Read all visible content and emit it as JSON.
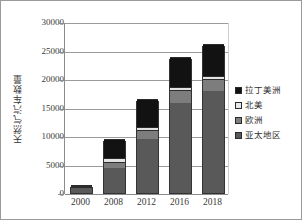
{
  "chart_data": {
    "type": "bar",
    "subtype": "stacked-column",
    "title": "",
    "xlabel": "",
    "ylabel": "天然气汽车数量",
    "categories": [
      "2000",
      "2008",
      "2012",
      "2016",
      "2018"
    ],
    "ylim": [
      0,
      30000
    ],
    "yticks": [
      0,
      5000,
      10000,
      15000,
      20000,
      25000,
      30000
    ],
    "ytick_labels": [
      "0",
      "5000",
      "10000",
      "15000",
      "20000",
      "25000",
      "30000"
    ],
    "grid": true,
    "grid_axis": "y",
    "legend_position": "right",
    "series": [
      {
        "name": "亚太地区",
        "key": "asia",
        "color": "#595959",
        "values": [
          1150,
          4500,
          9700,
          16000,
          18200
        ]
      },
      {
        "name": "欧洲",
        "key": "europe",
        "color": "#7d7d7d",
        "values": [
          80,
          900,
          1350,
          2150,
          1900
        ]
      },
      {
        "name": "北美",
        "key": "namerica",
        "color": "#e3e3e3",
        "values": [
          40,
          600,
          500,
          300,
          400
        ]
      },
      {
        "name": "拉丁美洲",
        "key": "latam",
        "color": "#121212",
        "values": [
          30,
          3300,
          4850,
          5250,
          5500
        ]
      }
    ],
    "totals": [
      1300,
      9300,
      16400,
      23700,
      26000
    ],
    "legend_order": [
      "拉丁美洲",
      "北美",
      "欧洲",
      "亚太地区"
    ]
  },
  "axes": {
    "y_tick_labels": [
      "30000",
      "25000",
      "20000",
      "15000",
      "10000",
      "5000",
      "0"
    ],
    "x_tick_labels": [
      "2000",
      "2008",
      "2012",
      "2016",
      "2018"
    ],
    "y_axis_title": "天然气汽车数量"
  },
  "legend": {
    "items": [
      {
        "label": "拉丁美洲",
        "swatch_class": "latam"
      },
      {
        "label": "北美",
        "swatch_class": "namerica"
      },
      {
        "label": "欧洲",
        "swatch_class": "europe"
      },
      {
        "label": "亚太地区",
        "swatch_class": "asia"
      }
    ]
  },
  "colors": {
    "latin_america": "#121212",
    "north_america": "#e3e3e3",
    "europe": "#7d7d7d",
    "asia_pacific": "#595959",
    "gridline": "#9b9b9b",
    "frame_border": "#9a9a9a",
    "text": "#3a3a3a"
  }
}
